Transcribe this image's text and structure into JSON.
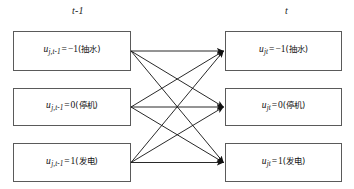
{
  "diagram": {
    "type": "state-transition-bipartite",
    "columns": [
      {
        "id": "previous",
        "header": "t-1"
      },
      {
        "id": "current",
        "header": "t"
      }
    ],
    "left_states": [
      {
        "id": "pump",
        "var": "u",
        "sub_index": "j,",
        "sub_time": "t-1",
        "equals": "=",
        "value": "−1",
        "mode_label": "(抽水)",
        "full_text": "u j, t-1 = −1(抽水)"
      },
      {
        "id": "shutdown",
        "var": "u",
        "sub_index": "j,",
        "sub_time": "t-1",
        "equals": "=",
        "value": "0",
        "mode_label": "(停机)",
        "full_text": "u j, t-1 = 0(停机)"
      },
      {
        "id": "generate",
        "var": "u",
        "sub_index": "j,",
        "sub_time": "t-1",
        "equals": "=",
        "value": "1",
        "mode_label": "(发电)",
        "full_text": "u j, t-1 = 1(发电)"
      }
    ],
    "right_states": [
      {
        "id": "pump",
        "var": "u",
        "sub_index": "jt",
        "equals": "=",
        "value": "−1",
        "mode_label": "(抽水)",
        "full_text": "u jt = −1(抽水)"
      },
      {
        "id": "shutdown",
        "var": "u",
        "sub_index": "jt",
        "equals": "=",
        "value": "0",
        "mode_label": "(停机)",
        "full_text": "u jt = 0(停机)"
      },
      {
        "id": "generate",
        "var": "u",
        "sub_index": "jt",
        "equals": "=",
        "value": "1",
        "mode_label": "(发电)",
        "full_text": "u jt = 1(发电)"
      }
    ],
    "transitions": [
      {
        "from": 0,
        "to": 0
      },
      {
        "from": 0,
        "to": 1
      },
      {
        "from": 0,
        "to": 2
      },
      {
        "from": 1,
        "to": 0
      },
      {
        "from": 1,
        "to": 1
      },
      {
        "from": 1,
        "to": 2
      },
      {
        "from": 2,
        "to": 0
      },
      {
        "from": 2,
        "to": 1
      },
      {
        "from": 2,
        "to": 2
      }
    ],
    "colors": {
      "box_border": "#5a5a5a",
      "arrow": "#111111",
      "text": "#111111",
      "background": "#ffffff"
    }
  }
}
